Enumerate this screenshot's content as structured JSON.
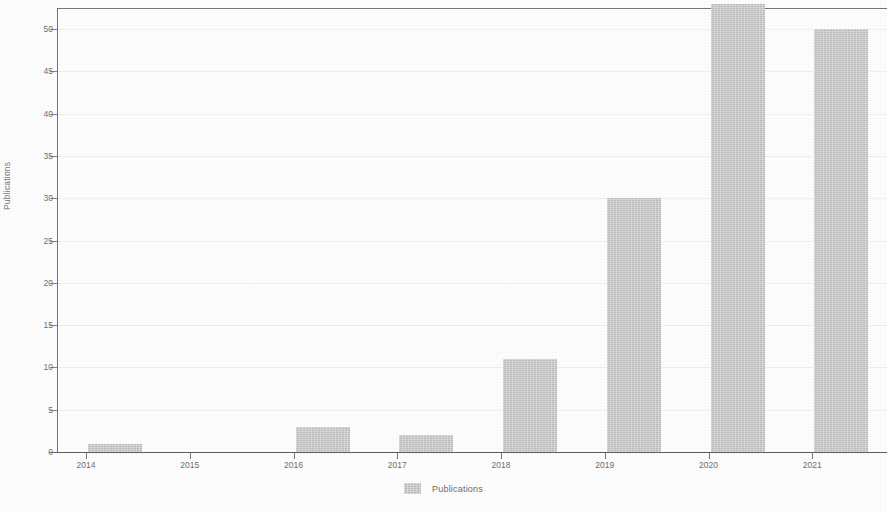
{
  "chart_data": {
    "type": "bar",
    "title": "",
    "xlabel": "",
    "ylabel": "Publications",
    "categories": [
      "2014",
      "2015",
      "2016",
      "2017",
      "2018",
      "2019",
      "2020",
      "2021"
    ],
    "values": [
      1,
      0,
      3,
      2,
      11,
      30,
      53,
      50
    ],
    "series": [
      {
        "name": "Publications",
        "values": [
          1,
          0,
          3,
          2,
          11,
          30,
          53,
          50
        ]
      }
    ],
    "ylim": [
      0,
      52.5
    ],
    "yticks": [
      0,
      5,
      10,
      15,
      20,
      25,
      30,
      35,
      40,
      45,
      50
    ],
    "ytick_labels": [
      "0",
      "5",
      "10",
      "15",
      "20",
      "25",
      "30",
      "35",
      "40",
      "45",
      "50"
    ],
    "grid": true,
    "legend": {
      "position": "bottom-center",
      "entries": [
        {
          "label": "Publications",
          "color": "#c9c9c9"
        }
      ]
    },
    "colors": {
      "bar": "#c9c9c9",
      "axis": "#5a5a5a",
      "text": "#6e6e6e",
      "background": "#fdfdfd",
      "grid": "#e8e8e8"
    }
  }
}
